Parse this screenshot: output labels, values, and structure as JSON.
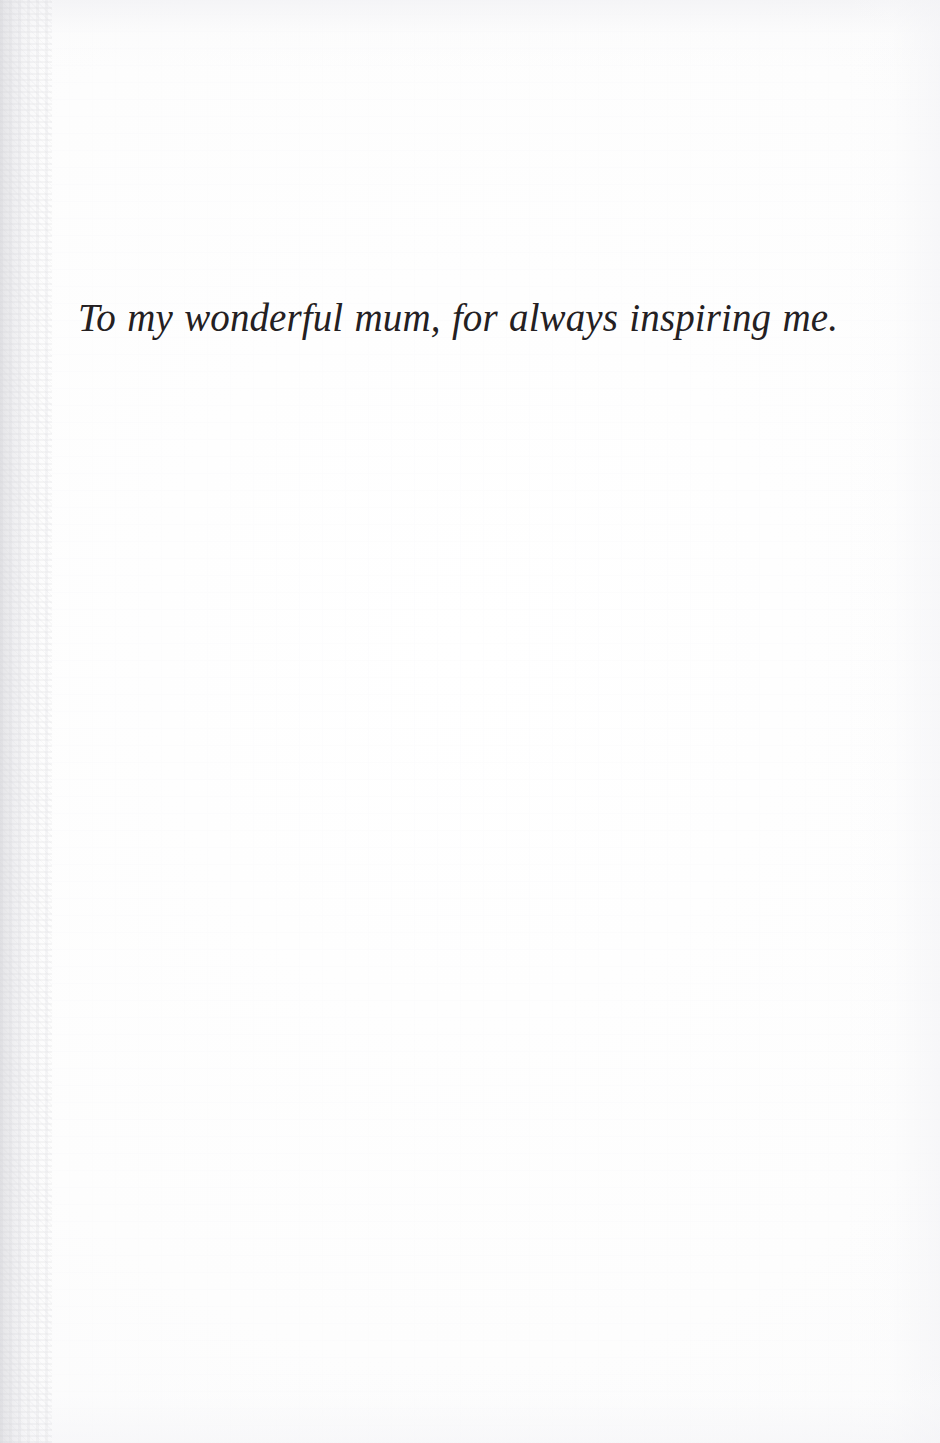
{
  "page": {
    "kind": "book-dedication-page",
    "width": 940,
    "height": 1443,
    "background_color": "#fefefe",
    "paper_edge_tint": "#f1f1f4",
    "gutter_edge": "left"
  },
  "dedication": {
    "text": "To my wonderful mum, for always inspiring me.",
    "ink_color": "#242022",
    "alignment": "center",
    "style": "italic-serif"
  }
}
